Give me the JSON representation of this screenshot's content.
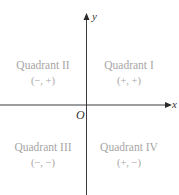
{
  "diagram": {
    "colors": {
      "axis": "#3a3a3a",
      "quadrant_text": "#a6a6a6",
      "axis_label": "#333333",
      "background": "#ffffff"
    },
    "axes": {
      "x_label": "x",
      "y_label": "y",
      "origin_label": "O"
    },
    "quadrants": [
      {
        "id": "I",
        "name": "Quadrant I",
        "signs": "(+, +)"
      },
      {
        "id": "II",
        "name": "Quadrant II",
        "signs": "(−, +)"
      },
      {
        "id": "III",
        "name": "Quadrant III",
        "signs": "(−, −)"
      },
      {
        "id": "IV",
        "name": "Quadrant IV",
        "signs": "(+, −)"
      }
    ]
  }
}
